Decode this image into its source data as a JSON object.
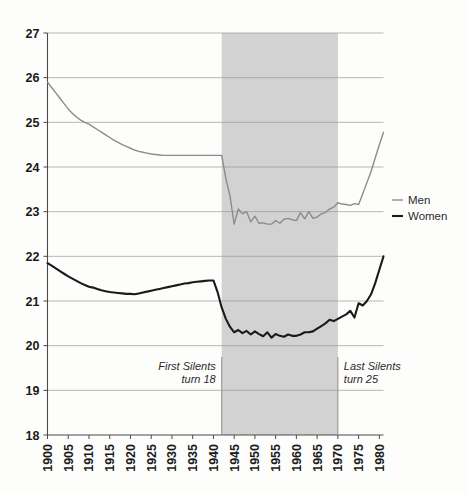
{
  "chart_data": {
    "type": "line",
    "title": "",
    "subtitle": "",
    "xlabel": "",
    "ylabel": "",
    "xlim": [
      1900,
      1981
    ],
    "ylim": [
      18,
      27
    ],
    "grid": true,
    "legend_position": "right",
    "y_ticks": [
      18,
      19,
      20,
      21,
      22,
      23,
      24,
      25,
      26,
      27
    ],
    "y_tick_labels": [
      "18",
      "19",
      "20",
      "21",
      "22",
      "23",
      "24",
      "25",
      "26",
      "27"
    ],
    "x_ticks": [
      1900,
      1905,
      1910,
      1915,
      1920,
      1925,
      1930,
      1935,
      1940,
      1945,
      1950,
      1955,
      1960,
      1965,
      1970,
      1975,
      1980
    ],
    "x_tick_labels": [
      "1900",
      "1905",
      "1910",
      "1915",
      "1920",
      "1925",
      "1930",
      "1935",
      "1940",
      "1945",
      "1950",
      "1955",
      "1960",
      "1965",
      "1970",
      "1975",
      "1980"
    ],
    "x": [
      1900,
      1901,
      1902,
      1903,
      1904,
      1905,
      1906,
      1907,
      1908,
      1909,
      1910,
      1911,
      1912,
      1913,
      1914,
      1915,
      1916,
      1917,
      1918,
      1919,
      1920,
      1921,
      1922,
      1923,
      1924,
      1925,
      1926,
      1927,
      1928,
      1929,
      1930,
      1931,
      1932,
      1933,
      1934,
      1935,
      1936,
      1937,
      1938,
      1939,
      1940,
      1941,
      1942,
      1943,
      1944,
      1945,
      1946,
      1947,
      1948,
      1949,
      1950,
      1951,
      1952,
      1953,
      1954,
      1955,
      1956,
      1957,
      1958,
      1959,
      1960,
      1961,
      1962,
      1963,
      1964,
      1965,
      1966,
      1967,
      1968,
      1969,
      1970,
      1971,
      1972,
      1973,
      1974,
      1975,
      1976,
      1977,
      1978,
      1979,
      1980,
      1981
    ],
    "series": [
      {
        "name": "Men",
        "color": "#8c8c8c",
        "values": [
          25.9,
          25.78,
          25.66,
          25.54,
          25.42,
          25.3,
          25.2,
          25.12,
          25.05,
          25.0,
          24.96,
          24.9,
          24.84,
          24.78,
          24.72,
          24.66,
          24.6,
          24.55,
          24.5,
          24.46,
          24.42,
          24.38,
          24.35,
          24.33,
          24.31,
          24.29,
          24.28,
          24.27,
          24.26,
          24.26,
          24.26,
          24.26,
          24.26,
          24.26,
          24.26,
          24.26,
          24.26,
          24.26,
          24.26,
          24.26,
          24.26,
          24.26,
          24.26,
          23.74,
          23.35,
          22.72,
          23.06,
          22.95,
          23.0,
          22.77,
          22.9,
          22.74,
          22.75,
          22.72,
          22.72,
          22.8,
          22.74,
          22.83,
          22.85,
          22.82,
          22.8,
          22.98,
          22.84,
          23.0,
          22.85,
          22.88,
          22.95,
          22.98,
          23.06,
          23.1,
          23.2,
          23.17,
          23.16,
          23.14,
          23.18,
          23.16,
          23.4,
          23.65,
          23.9,
          24.2,
          24.5,
          24.78
        ]
      },
      {
        "name": "Women",
        "color": "#1a1a1a",
        "values": [
          21.85,
          21.79,
          21.73,
          21.67,
          21.61,
          21.55,
          21.5,
          21.45,
          21.4,
          21.36,
          21.32,
          21.3,
          21.27,
          21.24,
          21.22,
          21.2,
          21.19,
          21.18,
          21.17,
          21.16,
          21.16,
          21.15,
          21.17,
          21.19,
          21.21,
          21.23,
          21.25,
          21.27,
          21.29,
          21.31,
          21.33,
          21.35,
          21.37,
          21.39,
          21.4,
          21.42,
          21.43,
          21.44,
          21.45,
          21.46,
          21.46,
          21.2,
          20.85,
          20.6,
          20.42,
          20.3,
          20.35,
          20.28,
          20.33,
          20.25,
          20.32,
          20.26,
          20.21,
          20.3,
          20.18,
          20.26,
          20.22,
          20.2,
          20.25,
          20.22,
          20.22,
          20.25,
          20.3,
          20.3,
          20.32,
          20.38,
          20.44,
          20.5,
          20.58,
          20.55,
          20.6,
          20.65,
          20.7,
          20.78,
          20.63,
          20.95,
          20.9,
          21.0,
          21.15,
          21.4,
          21.7,
          22.0
        ]
      }
    ],
    "shaded_region": {
      "start": 1942,
      "end": 1970,
      "color": "#d2d2d2"
    },
    "annotations": [
      {
        "id": "first-silents",
        "line1": "First Silents",
        "line2": "turn 18",
        "align": "right",
        "x": 1942
      },
      {
        "id": "last-silents",
        "line1": "Last Silents",
        "line2": "turn 25",
        "align": "left",
        "x": 1970
      }
    ],
    "legend": [
      {
        "label": "Men",
        "color": "#8c8c8c"
      },
      {
        "label": "Women",
        "color": "#1a1a1a"
      }
    ]
  }
}
